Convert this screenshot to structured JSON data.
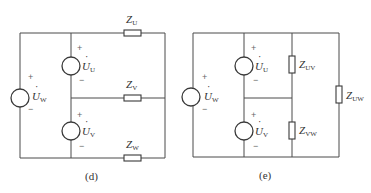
{
  "diagram_d": {
    "caption": "(d)",
    "sources": [
      {
        "id": "W",
        "main": "U",
        "sub": "W",
        "plus": "+",
        "minus": "−"
      },
      {
        "id": "U",
        "main": "U",
        "sub": "U",
        "plus": "+",
        "minus": "−"
      },
      {
        "id": "V",
        "main": "U",
        "sub": "V",
        "plus": "+",
        "minus": "−"
      }
    ],
    "impedances": [
      {
        "id": "ZU",
        "main": "Z",
        "sub": "U"
      },
      {
        "id": "ZV",
        "main": "Z",
        "sub": "V"
      },
      {
        "id": "ZW",
        "main": "Z",
        "sub": "W"
      }
    ]
  },
  "diagram_e": {
    "caption": "(e)",
    "sources": [
      {
        "id": "W",
        "main": "U",
        "sub": "W",
        "plus": "+",
        "minus": "−"
      },
      {
        "id": "U",
        "main": "U",
        "sub": "U",
        "plus": "+",
        "minus": "−"
      },
      {
        "id": "V",
        "main": "U",
        "sub": "V",
        "plus": "+",
        "minus": "−"
      }
    ],
    "impedances": [
      {
        "id": "ZUV",
        "main": "Z",
        "sub": "UV"
      },
      {
        "id": "ZVW",
        "main": "Z",
        "sub": "VW"
      },
      {
        "id": "ZUW",
        "main": "Z",
        "sub": "UW"
      }
    ]
  },
  "dot": "·"
}
